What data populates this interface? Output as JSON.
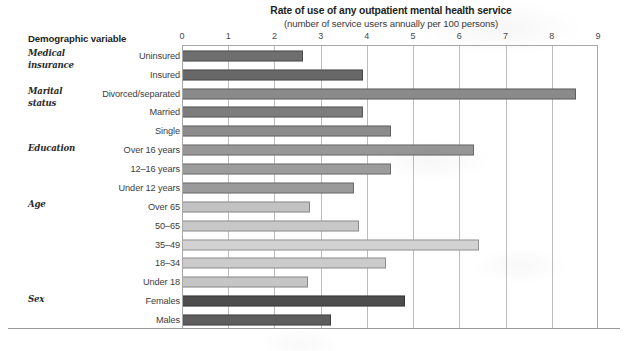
{
  "chart_data": {
    "type": "bar",
    "orientation": "horizontal",
    "title": "Rate of use of any outpatient mental health service",
    "subtitle": "(number of service users annually per 100 persons)",
    "xlabel": "",
    "ylabel": "Demographic variable",
    "xlim": [
      0,
      9
    ],
    "xticks": [
      0,
      1,
      2,
      3,
      4,
      5,
      6,
      7,
      8,
      9
    ],
    "xtick_labels": [
      "0",
      "1",
      "2",
      "3",
      "4",
      "5",
      "6",
      "7",
      "8",
      "9"
    ],
    "grid": true,
    "legend": null,
    "categories": [
      "Uninsured",
      "Insured",
      "Divorced/separated",
      "Married",
      "Single",
      "Over 16 years",
      "12–16 years",
      "Under 12 years",
      "Over 65",
      "50–65",
      "35–49",
      "18–34",
      "Under 18",
      "Females",
      "Males"
    ],
    "values": [
      2.6,
      3.9,
      8.5,
      3.9,
      4.5,
      6.3,
      4.5,
      3.7,
      2.75,
      3.8,
      6.4,
      4.4,
      2.7,
      4.8,
      3.2
    ],
    "bars": [
      {
        "label": "Uninsured",
        "value": 2.6,
        "color": "#6e6e6e",
        "group": "Medical insurance"
      },
      {
        "label": "Insured",
        "value": 3.9,
        "color": "#686868",
        "group": "Medical insurance"
      },
      {
        "label": "Divorced/separated",
        "value": 8.5,
        "color": "#8a8a8a",
        "group": "Marital status"
      },
      {
        "label": "Married",
        "value": 3.9,
        "color": "#7d7d7d",
        "group": "Marital status"
      },
      {
        "label": "Single",
        "value": 4.5,
        "color": "#8c8c8c",
        "group": "Marital status"
      },
      {
        "label": "Over 16 years",
        "value": 6.3,
        "color": "#979797",
        "group": "Education"
      },
      {
        "label": "12–16 years",
        "value": 4.5,
        "color": "#9c9c9c",
        "group": "Education"
      },
      {
        "label": "Under 12 years",
        "value": 3.7,
        "color": "#9a9a9a",
        "group": "Education"
      },
      {
        "label": "Over 65",
        "value": 2.75,
        "color": "#c2c2c2",
        "group": "Age"
      },
      {
        "label": "50–65",
        "value": 3.8,
        "color": "#c8c8c8",
        "group": "Age"
      },
      {
        "label": "35–49",
        "value": 6.4,
        "color": "#d2d2d2",
        "group": "Age"
      },
      {
        "label": "18–34",
        "value": 4.4,
        "color": "#cbcbcb",
        "group": "Age"
      },
      {
        "label": "Under 18",
        "value": 2.7,
        "color": "#c5c5c5",
        "group": "Age"
      },
      {
        "label": "Females",
        "value": 4.8,
        "color": "#4d4d4d",
        "group": "Sex"
      },
      {
        "label": "Males",
        "value": 3.2,
        "color": "#5d5d5d",
        "group": "Sex"
      }
    ],
    "groups": [
      {
        "label": "Medical\ninsurance",
        "first_row": 0
      },
      {
        "label": "Marital\nstatus",
        "first_row": 2
      },
      {
        "label": "Education",
        "first_row": 5
      },
      {
        "label": "Age",
        "first_row": 8
      },
      {
        "label": "Sex",
        "first_row": 13
      }
    ]
  },
  "header": {
    "demographic_variable": "Demographic variable"
  },
  "colors": {
    "text": "#231f20",
    "gridline": "#bdbdbd",
    "axis": "#a8a8a8",
    "background": "#ffffff"
  }
}
